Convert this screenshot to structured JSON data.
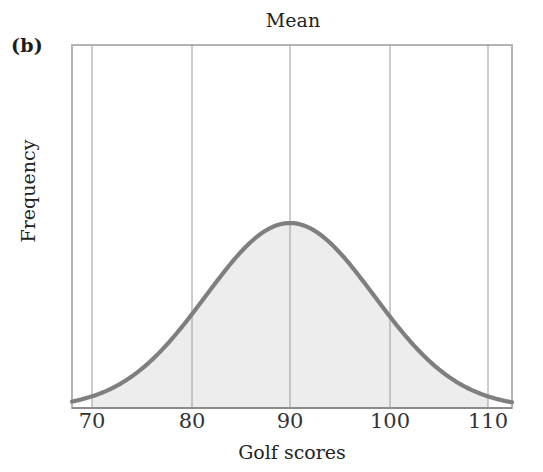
{
  "figure": {
    "panel_label": "(b)",
    "title": "Mean",
    "x_axis_title": "Golf scores",
    "y_axis_title": "Frequency"
  },
  "colors": {
    "curve_stroke": "#7f7f7f",
    "curve_fill": "#ededed",
    "gridline": "#9a9a9a",
    "frame": "#b4b4b4",
    "text": "#232323"
  },
  "ticks": [
    {
      "label": "70",
      "value": 70,
      "x": 92
    },
    {
      "label": "80",
      "value": 80,
      "x": 192
    },
    {
      "label": "90",
      "value": 90,
      "x": 290
    },
    {
      "label": "100",
      "value": 100,
      "x": 390
    },
    {
      "label": "110",
      "value": 110,
      "x": 488
    }
  ],
  "chart_data": {
    "type": "line",
    "title": "Mean",
    "xlabel": "Golf scores",
    "ylabel": "Frequency",
    "xlim": [
      67,
      112
    ],
    "ylim": [
      0,
      1
    ],
    "grid": true,
    "legend": null,
    "annotations": [
      {
        "text": "Mean",
        "x": 90,
        "note": "title positioned above the mean gridline at x = 90"
      },
      {
        "text": "(b)",
        "note": "panel identifier at upper left, outside plot frame"
      }
    ],
    "gridlines_x": [
      70,
      80,
      90,
      100,
      110
    ],
    "distribution": {
      "shape": "normal",
      "mean": 90,
      "std_dev": 8.5,
      "symmetric": true,
      "shaded": true
    },
    "tick_labels": [
      "70",
      "80",
      "90",
      "100",
      "110"
    ],
    "x": [
      67,
      68,
      70,
      72,
      74,
      76,
      78,
      80,
      82,
      84,
      86,
      88,
      90,
      92,
      94,
      96,
      98,
      100,
      102,
      104,
      106,
      108,
      110,
      112
    ],
    "y": [
      0.009,
      0.014,
      0.031,
      0.063,
      0.115,
      0.192,
      0.294,
      0.412,
      0.536,
      0.552,
      0.841,
      0.96,
      1.0,
      0.96,
      0.841,
      0.552,
      0.536,
      0.412,
      0.294,
      0.192,
      0.115,
      0.063,
      0.031,
      0.009
    ],
    "series": [
      {
        "name": "Golf score distribution",
        "values": [
          0.009,
          0.014,
          0.031,
          0.063,
          0.115,
          0.192,
          0.294,
          0.412,
          0.536,
          0.683,
          0.841,
          0.96,
          1.0,
          0.96,
          0.841,
          0.683,
          0.536,
          0.412,
          0.294,
          0.192,
          0.115,
          0.063,
          0.031,
          0.009
        ]
      }
    ]
  }
}
